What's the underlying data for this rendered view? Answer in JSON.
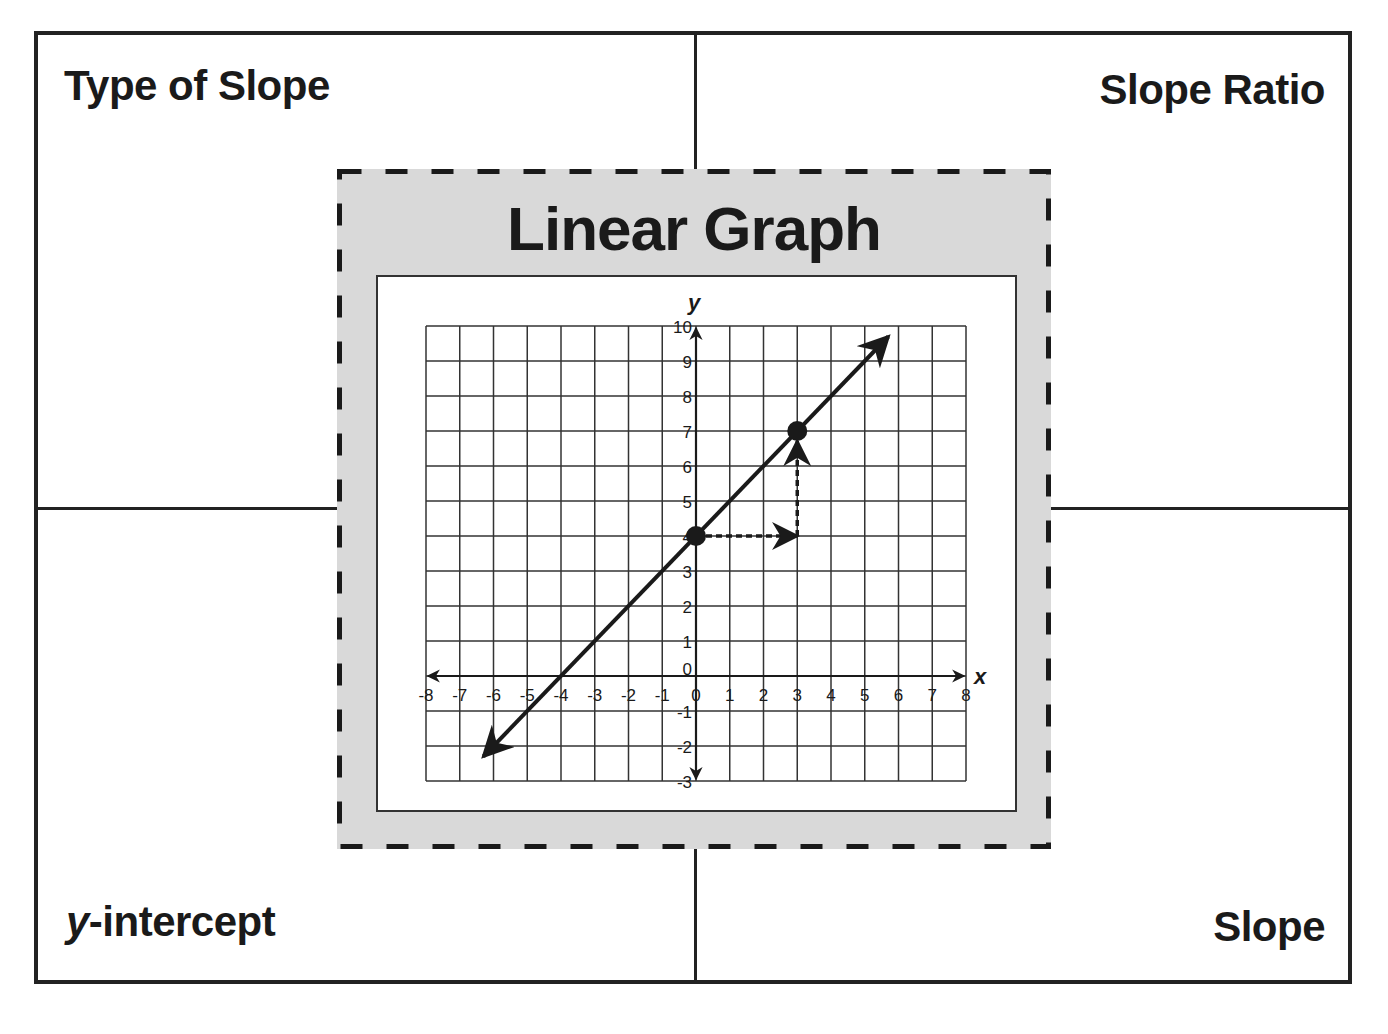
{
  "corners": {
    "top_left": "Type of Slope",
    "top_right": "Slope Ratio",
    "bottom_left_var": "y",
    "bottom_left_rest": "-intercept",
    "bottom_right": "Slope"
  },
  "center": {
    "title": "Linear Graph"
  },
  "colors": {
    "ink": "#1a1a1a",
    "panel_gray": "#d9d9d9",
    "paper": "#ffffff"
  },
  "chart_data": {
    "type": "line",
    "title": "Linear Graph",
    "xlabel": "x",
    "ylabel": "y",
    "xlim": [
      -8,
      8
    ],
    "ylim": [
      -3,
      10
    ],
    "grid": true,
    "x_ticks": [
      "-8",
      "-7",
      "-6",
      "-5",
      "-4",
      "-3",
      "-2",
      "-1",
      "0",
      "1",
      "2",
      "3",
      "4",
      "5",
      "6",
      "7",
      "8"
    ],
    "y_ticks": [
      "-3",
      "-2",
      "-1",
      "0",
      "1",
      "2",
      "3",
      "4",
      "5",
      "6",
      "7",
      "8",
      "9",
      "10"
    ],
    "series": [
      {
        "name": "line y = x + 4",
        "equation": "y = x + 4",
        "slope": 1,
        "y_intercept": 4,
        "x_intercept": -4,
        "arrows_both_ends": true,
        "x": [
          -6.3,
          5.7
        ],
        "y": [
          -2.3,
          9.7
        ]
      }
    ],
    "points": [
      {
        "x": 0,
        "y": 4,
        "label": "y-intercept"
      },
      {
        "x": 3,
        "y": 7
      }
    ],
    "annotations": [
      {
        "type": "run",
        "style": "dashed-arrow",
        "from": [
          0,
          4
        ],
        "to": [
          3,
          4
        ],
        "value": 3
      },
      {
        "type": "rise",
        "style": "dashed-arrow",
        "from": [
          3,
          4
        ],
        "to": [
          3,
          7
        ],
        "value": 3
      }
    ]
  }
}
